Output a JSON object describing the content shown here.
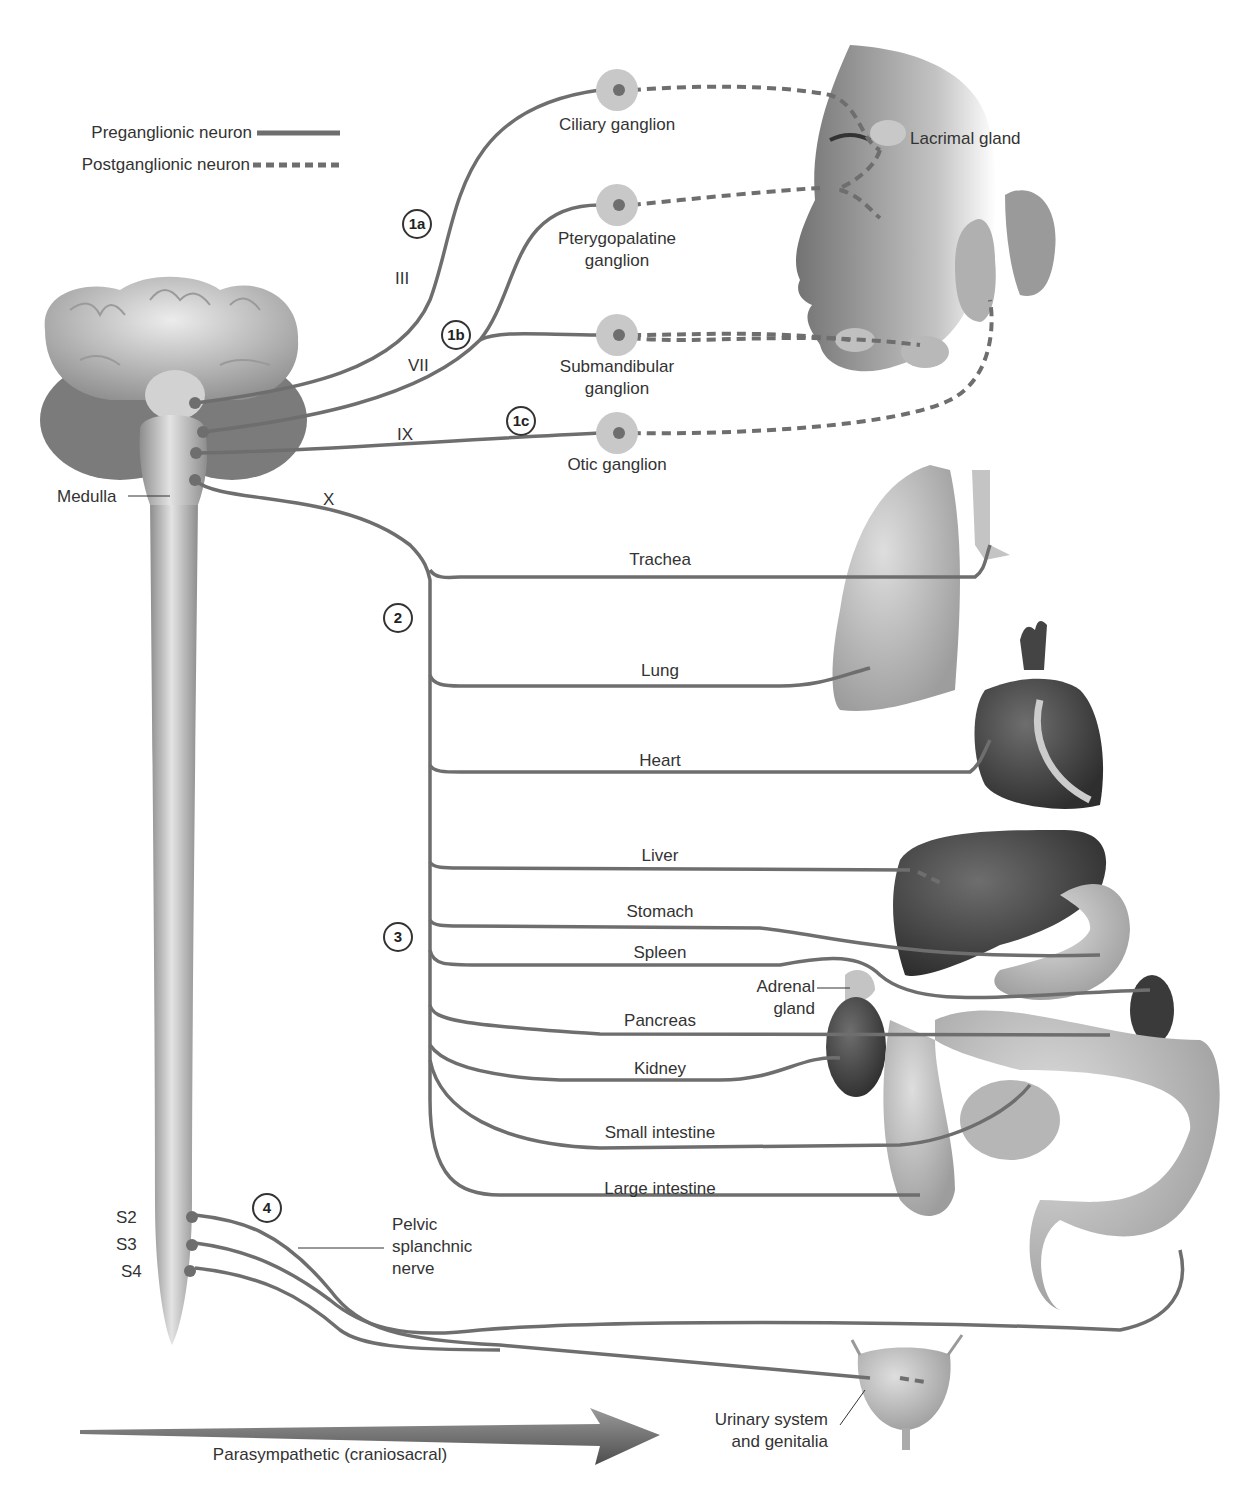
{
  "legend": {
    "preganglionic": "Preganglionic neuron",
    "postganglionic": "Postganglionic neuron"
  },
  "cranial_nerves": [
    "III",
    "VII",
    "IX",
    "X"
  ],
  "step_markers": [
    "1a",
    "1b",
    "1c",
    "2",
    "3",
    "4"
  ],
  "ganglia": [
    {
      "label": "Ciliary ganglion"
    },
    {
      "label_line1": "Pterygopalatine",
      "label_line2": "ganglion"
    },
    {
      "label_line1": "Submandibular",
      "label_line2": "ganglion"
    },
    {
      "label": "Otic ganglion"
    }
  ],
  "targets": {
    "lacrimal": "Lacrimal gland",
    "medulla": "Medulla",
    "organs": [
      "Trachea",
      "Lung",
      "Heart",
      "Liver",
      "Stomach",
      "Spleen",
      "Pancreas",
      "Kidney",
      "Small intestine",
      "Large intestine"
    ],
    "adrenal_line1": "Adrenal",
    "adrenal_line2": "gland"
  },
  "sacral": {
    "segments": [
      "S2",
      "S3",
      "S4"
    ],
    "nerve_line1": "Pelvic",
    "nerve_line2": "splanchnic",
    "nerve_line3": "nerve"
  },
  "urinary": {
    "line1": "Urinary system",
    "line2": "and genitalia"
  },
  "arrow_label": "Parasympathetic (craniosacral)",
  "colors": {
    "nerve": "#6e6e6e",
    "ganglion_fill": "#c8c8c8",
    "organ_dark": "#4a4a4a",
    "organ_light": "#bdbdbd",
    "text": "#333333"
  }
}
